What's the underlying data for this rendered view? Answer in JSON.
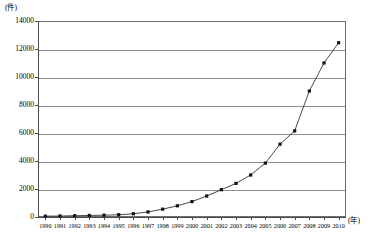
{
  "chart_data": {
    "type": "line",
    "title": "",
    "xlabel": "(年)",
    "ylabel": "(件)",
    "ylim": [
      0,
      14000
    ],
    "ytick_labels": [
      "0",
      "2000",
      "4000",
      "6000",
      "8000",
      "10000",
      "12000",
      "14000"
    ],
    "ytick_values": [
      0,
      2000,
      4000,
      6000,
      8000,
      10000,
      12000,
      14000
    ],
    "grid": "horizontal",
    "legend": "none",
    "marker": "filled-square",
    "line_color": "#333333",
    "marker_color": "#111111",
    "grid_color": "#8d8d8d",
    "categories": [
      "1990",
      "1991",
      "1992",
      "1993",
      "1994",
      "1995",
      "1996",
      "1997",
      "1998",
      "1999",
      "2000",
      "2001",
      "2002",
      "2003",
      "2004",
      "2005",
      "2006",
      "2007",
      "2008",
      "2009",
      "2010"
    ],
    "x": [
      1990,
      1991,
      1992,
      1993,
      1994,
      1995,
      1996,
      1997,
      1998,
      1999,
      2000,
      2001,
      2002,
      2003,
      2004,
      2005,
      2006,
      2007,
      2008,
      2009,
      2010
    ],
    "values": [
      60,
      70,
      90,
      110,
      130,
      160,
      230,
      360,
      560,
      800,
      1100,
      1500,
      1950,
      2400,
      3000,
      3850,
      5200,
      6150,
      9000,
      11000,
      12450
    ],
    "series": [
      {
        "name": "件数",
        "values": [
          60,
          70,
          90,
          110,
          130,
          160,
          230,
          360,
          560,
          800,
          1100,
          1500,
          1950,
          2400,
          3000,
          3850,
          5200,
          6150,
          9000,
          11000,
          12450
        ]
      }
    ]
  },
  "axes": {
    "y_unit_label": "(件)",
    "x_unit_label": "(年)"
  }
}
